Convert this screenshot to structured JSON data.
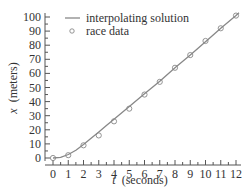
{
  "chart_data": {
    "type": "line",
    "title": "",
    "xlabel_var": "t",
    "xlabel_unit": "(seconds)",
    "ylabel_var": "x",
    "ylabel_unit": "(meters)",
    "xlim": [
      0,
      12
    ],
    "ylim": [
      0,
      100
    ],
    "x_ticks": [
      0,
      1,
      2,
      3,
      4,
      5,
      6,
      7,
      8,
      9,
      10,
      11,
      12
    ],
    "y_ticks": [
      0,
      10,
      20,
      30,
      40,
      50,
      60,
      70,
      80,
      90,
      100
    ],
    "grid": false,
    "legend_position": "upper left",
    "series": [
      {
        "name": "interpolating solution",
        "style": "line",
        "color": "#888888",
        "x": [
          0,
          0.5,
          1,
          1.5,
          2,
          2.5,
          3,
          3.5,
          4,
          5,
          6,
          7,
          8,
          9,
          10,
          11,
          12,
          12.2
        ],
        "values": [
          0,
          0.5,
          2.5,
          5.5,
          9.5,
          14,
          18.5,
          23,
          27.5,
          36.5,
          45.5,
          54.5,
          64,
          73,
          82.5,
          92,
          101,
          103
        ]
      },
      {
        "name": "race data",
        "style": "markers",
        "marker": "open-circle",
        "color": "#888888",
        "x": [
          0,
          1,
          2,
          3,
          4,
          5,
          6,
          7,
          8,
          9,
          10,
          11,
          12
        ],
        "values": [
          0,
          2,
          9,
          16,
          26,
          35,
          45,
          54,
          64,
          73,
          83,
          92,
          101
        ]
      }
    ]
  },
  "legend": {
    "line_label": "interpolating solution",
    "marker_label": "race data"
  },
  "axes": {
    "x_var": "t",
    "x_unit": "(seconds)",
    "y_var": "x",
    "y_unit": "(meters)"
  }
}
